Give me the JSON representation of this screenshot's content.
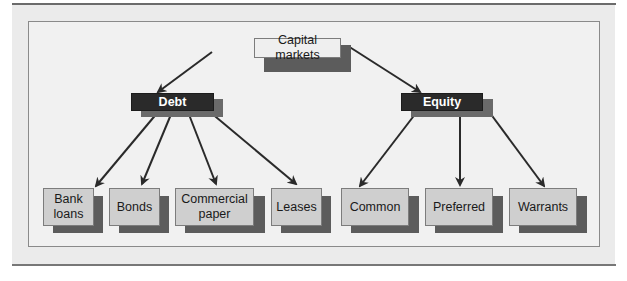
{
  "diagram": {
    "type": "hierarchy",
    "root": {
      "id": "capital_markets",
      "label": "Capital markets"
    },
    "level1": [
      {
        "id": "debt",
        "label": "Debt"
      },
      {
        "id": "equity",
        "label": "Equity"
      }
    ],
    "leaves": [
      {
        "id": "bank_loans",
        "label": "Bank\nloans",
        "parent": "debt"
      },
      {
        "id": "bonds",
        "label": "Bonds",
        "parent": "debt"
      },
      {
        "id": "commercial_paper",
        "label": "Commercial\npaper",
        "parent": "debt"
      },
      {
        "id": "leases",
        "label": "Leases",
        "parent": "debt"
      },
      {
        "id": "common",
        "label": "Common",
        "parent": "equity"
      },
      {
        "id": "preferred",
        "label": "Preferred",
        "parent": "equity"
      },
      {
        "id": "warrants",
        "label": "Warrants",
        "parent": "equity"
      }
    ],
    "edges": [
      [
        "capital_markets",
        "debt"
      ],
      [
        "capital_markets",
        "equity"
      ],
      [
        "debt",
        "bank_loans"
      ],
      [
        "debt",
        "bonds"
      ],
      [
        "debt",
        "commercial_paper"
      ],
      [
        "debt",
        "leases"
      ],
      [
        "equity",
        "common"
      ],
      [
        "equity",
        "preferred"
      ],
      [
        "equity",
        "warrants"
      ]
    ]
  },
  "labels": {
    "root": "Capital markets",
    "debt": "Debt",
    "equity": "Equity",
    "bank_loans_1": "Bank",
    "bank_loans_2": "loans",
    "bonds": "Bonds",
    "commercial_paper_1": "Commercial",
    "commercial_paper_2": "paper",
    "leases": "Leases",
    "common": "Common",
    "preferred": "Preferred",
    "warrants": "Warrants"
  },
  "colors": {
    "panel": "#ebebeb",
    "leaf_fill": "#cfcfcf",
    "dark_fill": "#2a2a2a",
    "shadow": "#5c5c5c",
    "arrow": "#2a2a2a"
  }
}
